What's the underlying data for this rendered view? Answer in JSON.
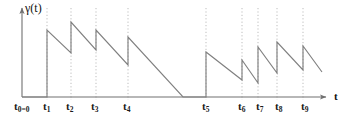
{
  "figure": {
    "title": "",
    "background_color": "#ffffff",
    "curve_color": "#808080",
    "axis_color": "#707070",
    "guide_color": "#b5b5b5",
    "text_color": "#1a1a1a"
  },
  "axes": {
    "y_label": "γ(t)",
    "x_label": "t",
    "origin_label": "t₀=0"
  },
  "tick_labels": [
    {
      "name": "t0",
      "text": "t",
      "sub": "0=0",
      "x": 14
    },
    {
      "name": "t1",
      "text": "t",
      "sub": "1",
      "x": 43
    },
    {
      "name": "t2",
      "text": "t",
      "sub": "2",
      "x": 66
    },
    {
      "name": "t3",
      "text": "t",
      "sub": "3",
      "x": 91
    },
    {
      "name": "t4",
      "text": "t",
      "sub": "4",
      "x": 123
    },
    {
      "name": "t5",
      "text": "t",
      "sub": "5",
      "x": 202
    },
    {
      "name": "t6",
      "text": "t",
      "sub": "6",
      "x": 238
    },
    {
      "name": "t7",
      "text": "t",
      "sub": "7",
      "x": 256
    },
    {
      "name": "t8",
      "text": "t",
      "sub": "8",
      "x": 275
    },
    {
      "name": "t9",
      "text": "t",
      "sub": "9",
      "x": 301
    }
  ],
  "chart_data": {
    "type": "line",
    "title": "",
    "xlabel": "t",
    "ylabel": "γ(t)",
    "grid": false,
    "legend": null,
    "event_times": [
      "t0=0",
      "t1",
      "t2",
      "t3",
      "t4",
      "t5",
      "t6",
      "t7",
      "t8",
      "t9"
    ],
    "event_x_px": [
      22,
      47,
      71,
      96,
      128,
      206,
      242,
      258,
      277,
      303
    ],
    "axis_px": {
      "origin_x": 22,
      "origin_y": 97,
      "y_top": 5,
      "x_right": 330
    },
    "vertical_guides_px": [
      47,
      71,
      96,
      128,
      206,
      242,
      258,
      277,
      303
    ],
    "segments_px": [
      {
        "name": "flat-before-t1",
        "points": [
          [
            22,
            97
          ],
          [
            47,
            97
          ]
        ]
      },
      {
        "name": "jump-t1",
        "points": [
          [
            47,
            97
          ],
          [
            47,
            30
          ]
        ]
      },
      {
        "name": "decay-t1-t2",
        "points": [
          [
            47,
            30
          ],
          [
            71,
            53
          ]
        ]
      },
      {
        "name": "jump-t2",
        "points": [
          [
            71,
            53
          ],
          [
            71,
            22
          ]
        ]
      },
      {
        "name": "decay-t2-t3",
        "points": [
          [
            71,
            22
          ],
          [
            96,
            50
          ]
        ]
      },
      {
        "name": "jump-t3",
        "points": [
          [
            96,
            50
          ],
          [
            96,
            30
          ]
        ]
      },
      {
        "name": "decay-t3-t4",
        "points": [
          [
            96,
            30
          ],
          [
            128,
            65
          ]
        ]
      },
      {
        "name": "jump-t4",
        "points": [
          [
            128,
            65
          ],
          [
            128,
            37
          ]
        ]
      },
      {
        "name": "decay-t4-zero",
        "points": [
          [
            128,
            37
          ],
          [
            183,
            97
          ]
        ]
      },
      {
        "name": "flat-zero-to-t5",
        "points": [
          [
            183,
            97
          ],
          [
            206,
            97
          ]
        ]
      },
      {
        "name": "jump-t5",
        "points": [
          [
            206,
            97
          ],
          [
            206,
            52
          ]
        ]
      },
      {
        "name": "decay-t5-t6",
        "points": [
          [
            206,
            52
          ],
          [
            242,
            80
          ]
        ]
      },
      {
        "name": "jump-t6",
        "points": [
          [
            242,
            80
          ],
          [
            242,
            60
          ]
        ]
      },
      {
        "name": "decay-t6-t7",
        "points": [
          [
            242,
            60
          ],
          [
            258,
            83
          ]
        ]
      },
      {
        "name": "jump-t7",
        "points": [
          [
            258,
            83
          ],
          [
            258,
            47
          ]
        ]
      },
      {
        "name": "decay-t7-t8",
        "points": [
          [
            258,
            47
          ],
          [
            277,
            73
          ]
        ]
      },
      {
        "name": "jump-t8",
        "points": [
          [
            277,
            73
          ],
          [
            277,
            42
          ]
        ]
      },
      {
        "name": "decay-t8-t9",
        "points": [
          [
            277,
            42
          ],
          [
            303,
            70
          ]
        ]
      },
      {
        "name": "jump-t9",
        "points": [
          [
            303,
            70
          ],
          [
            303,
            46
          ]
        ]
      },
      {
        "name": "decay-after-t9",
        "points": [
          [
            303,
            46
          ],
          [
            322,
            72
          ]
        ]
      }
    ],
    "ylim_px": [
      97,
      5
    ],
    "xlim_px": [
      22,
      330
    ]
  }
}
